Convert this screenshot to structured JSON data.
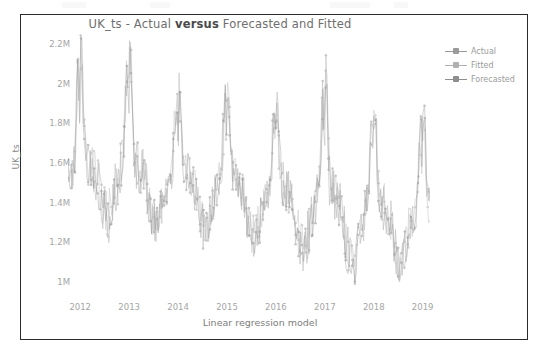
{
  "chart_data": {
    "type": "line",
    "title": "UK_ts - Actual versus Forecasted and Fitted",
    "title_emphasis": "versus",
    "xlabel": "Linear regression model",
    "ylabel": "UK_ts",
    "grid": false,
    "legend_position": "right-outside",
    "xlim": [
      2011.75,
      2019.15
    ],
    "ylim": [
      950000,
      2270000
    ],
    "xticks": [
      "2012",
      "2013",
      "2014",
      "2015",
      "2016",
      "2017",
      "2018",
      "2019"
    ],
    "xtick_values": [
      2012,
      2013,
      2014,
      2015,
      2016,
      2017,
      2018,
      2019
    ],
    "yticks": [
      "1M",
      "1.2M",
      "1.4M",
      "1.6M",
      "1.8M",
      "2M",
      "2.2M"
    ],
    "ytick_values": [
      1000000,
      1200000,
      1400000,
      1600000,
      1800000,
      2000000,
      2200000
    ],
    "series": [
      {
        "name": "Actual",
        "color": "#9a9a9a",
        "marker": "circle",
        "description": "Dense daily observations 2012-2019 with strong annual seasonal spikes",
        "annual_peaks": [
          2200000,
          2225000,
          1955000,
          2000000,
          1915000,
          2035000,
          1890000,
          1870000
        ],
        "annual_troughs": [
          1330000,
          1280000,
          1260000,
          1230000,
          1160000,
          1130000,
          1000000,
          1120000
        ],
        "baseline": [
          1620000,
          1600000,
          1575000,
          1545000,
          1500000,
          1465000,
          1405000,
          1395000
        ]
      },
      {
        "name": "Fitted",
        "color": "#b0b0b0",
        "marker": "circle",
        "description": "Regression fit overlaying the actual series through 2018",
        "annual_peaks": [
          2150000,
          2160000,
          1930000,
          1975000,
          1890000,
          1985000,
          1855000,
          1840000
        ],
        "annual_troughs": [
          1360000,
          1310000,
          1285000,
          1255000,
          1190000,
          1155000,
          1040000,
          1140000
        ],
        "baseline": [
          1610000,
          1590000,
          1565000,
          1535000,
          1492000,
          1458000,
          1400000,
          1390000
        ]
      },
      {
        "name": "Forecasted",
        "color": "#8e8e8e",
        "marker": "circle",
        "description": "Forecast band, visually coincident with fitted values",
        "annual_peaks": [
          2170000,
          2180000,
          1940000,
          1985000,
          1900000,
          2000000,
          1865000,
          1855000
        ],
        "annual_troughs": [
          1345000,
          1295000,
          1272000,
          1242000,
          1175000,
          1142000,
          1020000,
          1130000
        ],
        "baseline": [
          1615000,
          1595000,
          1570000,
          1540000,
          1496000,
          1462000,
          1402000,
          1392000
        ]
      }
    ]
  }
}
